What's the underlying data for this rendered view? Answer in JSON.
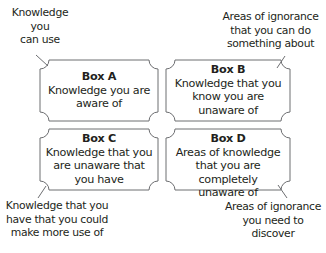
{
  "diagram": {
    "stroke_color": "#6d6e71",
    "text_color": "#231f20",
    "boxes": [
      {
        "id": "A",
        "title": "Box A",
        "lines": [
          "Knowledge you are",
          "aware of"
        ]
      },
      {
        "id": "B",
        "title": "Box B",
        "lines": [
          "Knowledge that you",
          "know you are",
          "unaware of"
        ]
      },
      {
        "id": "C",
        "title": "Box C",
        "lines": [
          "Knowledge that you",
          "are unaware that",
          "you have"
        ]
      },
      {
        "id": "D",
        "title": "Box D",
        "lines": [
          "Areas of knowledge",
          "that you are completely",
          "unaware of"
        ]
      }
    ],
    "callouts": {
      "top_left": [
        "Knowledge",
        "you",
        "can use"
      ],
      "top_right": [
        "Areas of ignorance",
        "that you can do",
        "something about"
      ],
      "bottom_left": [
        "Knowledge that you",
        "have that you could",
        "make more use of"
      ],
      "bottom_right": [
        "Areas of ignorance",
        "you need to",
        "discover"
      ]
    }
  }
}
